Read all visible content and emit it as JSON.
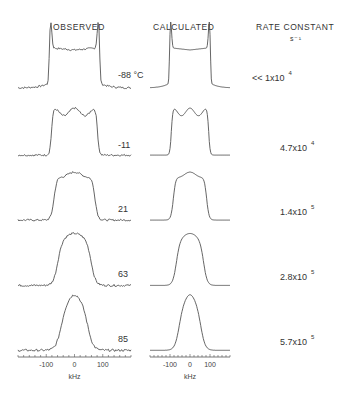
{
  "chart_data": {
    "type": "line",
    "title": "",
    "column_headers": {
      "observed": "OBSERVED",
      "calculated": "CALCULATED",
      "rate": "RATE CONSTANT",
      "rate_unit": "s⁻¹"
    },
    "xlabel": "kHz",
    "xlim": [
      -200,
      200
    ],
    "x_tick_labels": [
      "-100",
      "0",
      "100"
    ],
    "x_tick_values": [
      -100,
      0,
      100
    ],
    "minor_tick_step": 20,
    "spectra": [
      {
        "temperature": "-88",
        "temp_unit": "°C",
        "rate_prefix": "<<",
        "rate_mantissa": "1x10",
        "rate_exponent": "4",
        "shape": "pake",
        "dip": 0.75
      },
      {
        "temperature": "-11",
        "temp_unit": "",
        "rate_prefix": "",
        "rate_mantissa": "4.7x10",
        "rate_exponent": "4",
        "shape": "triplet",
        "dip": 0.9
      },
      {
        "temperature": "21",
        "temp_unit": "",
        "rate_prefix": "",
        "rate_mantissa": "1.4x10",
        "rate_exponent": "5",
        "shape": "flat",
        "dip": 0.95
      },
      {
        "temperature": "63",
        "temp_unit": "",
        "rate_prefix": "",
        "rate_mantissa": "2.8x10",
        "rate_exponent": "5",
        "shape": "rounded",
        "dip": 1.0
      },
      {
        "temperature": "85",
        "temp_unit": "",
        "rate_prefix": "",
        "rate_mantissa": "5.7x10",
        "rate_exponent": "5",
        "shape": "peak",
        "dip": 1.0
      }
    ]
  }
}
